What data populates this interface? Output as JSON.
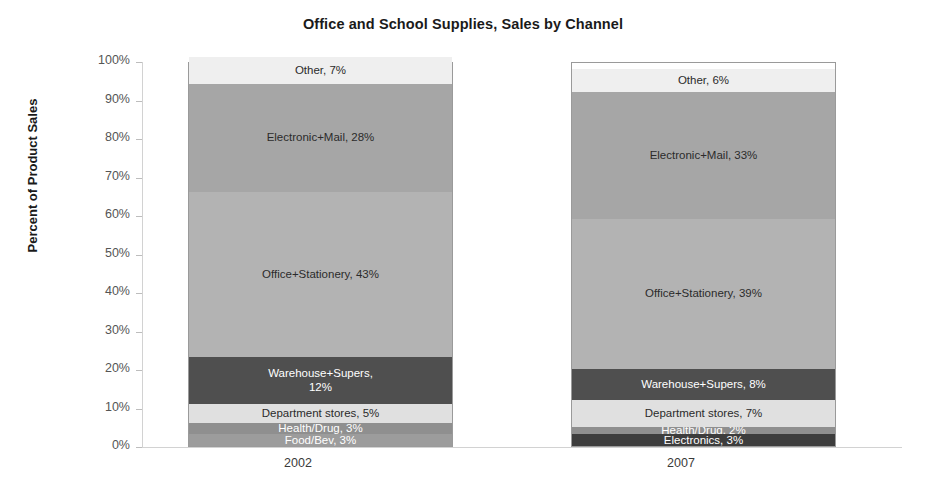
{
  "chart_data": {
    "type": "bar",
    "subtype": "stacked-100-percent",
    "title": "Office and School Supplies, Sales by Channel",
    "xlabel": "",
    "ylabel": "Percent of Product Sales",
    "categories": [
      "2002",
      "2007"
    ],
    "ylim": [
      0,
      100
    ],
    "ytick_labels": [
      "100%",
      "90%",
      "80%",
      "70%",
      "60%",
      "50%",
      "40%",
      "30%",
      "20%",
      "10%",
      "0%"
    ],
    "ytick_values": [
      100,
      90,
      80,
      70,
      60,
      50,
      40,
      30,
      20,
      10,
      0
    ],
    "grid": false,
    "legend": "none",
    "series": [
      {
        "name": "Other",
        "values": [
          7,
          6
        ],
        "color": "#efefef",
        "text_color": "#2b2b2b",
        "labels": [
          "Other, 7%",
          "Other, 6%"
        ]
      },
      {
        "name": "Electronic+Mail",
        "values": [
          28,
          33
        ],
        "color": "#a6a6a6",
        "text_color": "#2b2b2b",
        "labels": [
          "Electronic+Mail, 28%",
          "Electronic+Mail, 33%"
        ]
      },
      {
        "name": "Office+Stationery",
        "values": [
          43,
          39
        ],
        "color": "#b3b3b3",
        "text_color": "#2b2b2b",
        "labels": [
          "Office+Stationery, 43%",
          "Office+Stationery, 39%"
        ]
      },
      {
        "name": "Warehouse+Supers",
        "values": [
          12,
          8
        ],
        "color": "#4f4f4f",
        "text_color": "#ffffff",
        "labels": [
          "Warehouse+Supers,\n12%",
          "Warehouse+Supers, 8%"
        ]
      },
      {
        "name": "Department stores",
        "values": [
          5,
          7
        ],
        "color": "#e0e0e0",
        "text_color": "#2b2b2b",
        "labels": [
          "Department stores, 5%",
          "Department stores, 7%"
        ]
      },
      {
        "name": "Health/Drug",
        "values": [
          3,
          2
        ],
        "color": "#8f8f8f",
        "text_color": "#ffffff",
        "labels": [
          "Health/Drug, 3%",
          "Health/Drug, 2%"
        ]
      },
      {
        "name": "Food/Bev",
        "values": [
          3,
          0
        ],
        "color": "#9c9c9c",
        "text_color": "#ffffff",
        "labels": [
          "Food/Bev, 3%",
          ""
        ]
      },
      {
        "name": "Electronics",
        "values": [
          0,
          3
        ],
        "color": "#3d3d3d",
        "text_color": "#ffffff",
        "labels": [
          "",
          "Electronics, 3%"
        ]
      }
    ]
  }
}
